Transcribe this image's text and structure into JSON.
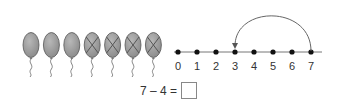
{
  "balloons": {
    "total": 7,
    "crossed_out": 4,
    "color": "#9a9a9a",
    "items": [
      {
        "index": 1,
        "crossed": false
      },
      {
        "index": 2,
        "crossed": false
      },
      {
        "index": 3,
        "crossed": false
      },
      {
        "index": 4,
        "crossed": true
      },
      {
        "index": 5,
        "crossed": true
      },
      {
        "index": 6,
        "crossed": true
      },
      {
        "index": 7,
        "crossed": true
      }
    ]
  },
  "number_line": {
    "ticks": [
      "0",
      "1",
      "2",
      "3",
      "4",
      "5",
      "6",
      "7"
    ],
    "jump_from": "7",
    "jump_to": "3"
  },
  "equation": {
    "text": "7 – 4 =",
    "answer": ""
  }
}
